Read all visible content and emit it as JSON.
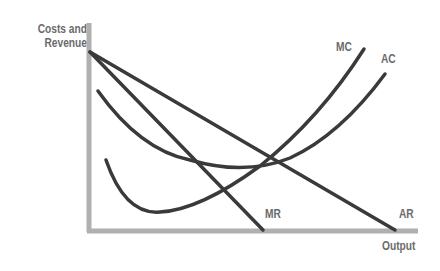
{
  "diagram": {
    "title": "",
    "y_axis_label_line1": "Costs and",
    "y_axis_label_line2": "Revenue",
    "x_axis_label": "Output",
    "curves": [
      {
        "name": "MC",
        "label": "MC"
      },
      {
        "name": "AC",
        "label": "AC"
      },
      {
        "name": "MR",
        "label": "MR"
      },
      {
        "name": "AR",
        "label": "AR"
      }
    ],
    "colors": {
      "axis": "#b0b0b0",
      "curve": "#3a3a3a",
      "label": "#6b6b6b"
    }
  }
}
